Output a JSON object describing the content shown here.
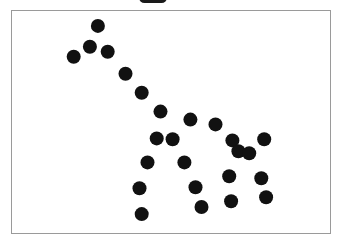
{
  "legend": {
    "marker_color": "#1a1a1a",
    "label": ""
  },
  "plot": {
    "frame_color": "#9a9a9a",
    "background": "#ffffff",
    "point_color": "#111111",
    "point_radius_px": 7
  },
  "chart_data": {
    "type": "scatter",
    "title": "",
    "xlabel": "",
    "ylabel": "",
    "xlim": [
      0,
      100
    ],
    "ylim": [
      0,
      100
    ],
    "grid": false,
    "axes_ticks_visible": false,
    "legend_position": "top-center (clipped)",
    "series": [
      {
        "name": "points",
        "color": "#111111",
        "x": [
          27.0,
          24.5,
          30.1,
          19.4,
          35.7,
          40.8,
          46.7,
          56.1,
          64.0,
          45.5,
          50.5,
          69.3,
          79.3,
          71.2,
          74.6,
          42.6,
          54.2,
          68.3,
          78.4,
          40.1,
          57.7,
          79.9,
          68.9,
          59.6,
          40.8
        ],
        "y": [
          93.3,
          83.9,
          81.6,
          79.4,
          71.7,
          63.2,
          54.7,
          51.1,
          48.9,
          42.6,
          42.2,
          41.7,
          42.2,
          36.8,
          35.9,
          31.8,
          31.8,
          25.6,
          24.7,
          20.2,
          20.6,
          16.1,
          14.3,
          11.7,
          8.5
        ]
      }
    ]
  }
}
